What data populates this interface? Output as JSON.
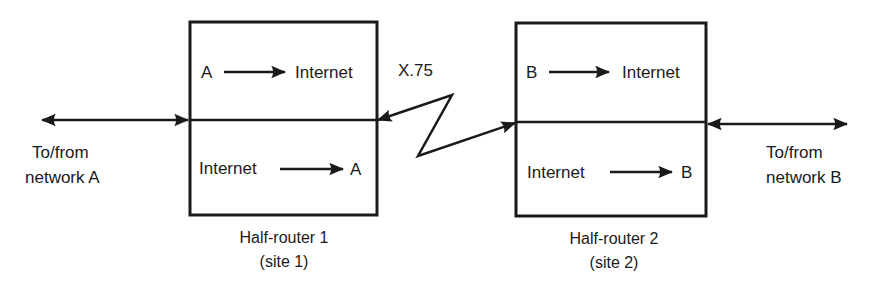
{
  "diagram": {
    "type": "network-diagram",
    "colors": {
      "ink": "#1a1a1a",
      "background": "#ffffff"
    },
    "link_label": "X.75",
    "routers": [
      {
        "name": "Half-router 1",
        "site": "(site 1)",
        "top": {
          "from": "A",
          "to": "Internet"
        },
        "bottom": {
          "from": "Internet",
          "to": "A"
        }
      },
      {
        "name": "Half-router 2",
        "site": "(site 2)",
        "top": {
          "from": "B",
          "to": "Internet"
        },
        "bottom": {
          "from": "Internet",
          "to": "B"
        }
      }
    ],
    "endpoints": [
      {
        "line1": "To/from",
        "line2": "network A"
      },
      {
        "line1": "To/from",
        "line2": "network B"
      }
    ]
  }
}
